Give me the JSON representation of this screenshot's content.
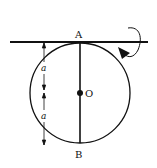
{
  "diagram": {
    "labels": {
      "top_point": "A",
      "center_point": "O",
      "bottom_point": "B",
      "upper_dimension": "a",
      "lower_dimension": "a"
    },
    "elements": {
      "circle": "circular disc/ring",
      "axis": "horizontal tangent axis through A",
      "diameter": "vertical diameter AB through center O",
      "rotation": "rotation arrow about horizontal axis"
    },
    "colors": {
      "stroke": "#111111",
      "background": "#ffffff"
    }
  }
}
